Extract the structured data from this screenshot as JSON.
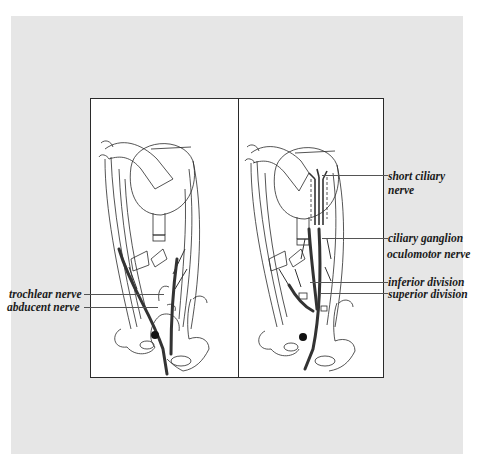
{
  "figure": {
    "panels": [
      {
        "id": "left",
        "description": "Orbit with extraocular muscles showing trochlear and abducent nerves"
      },
      {
        "id": "right",
        "description": "Orbit showing oculomotor nerve divisions, ciliary ganglion and short ciliary nerves"
      }
    ],
    "labels_left": [
      {
        "text": "trochlear nerve"
      },
      {
        "text": "abducent nerve"
      }
    ],
    "labels_right": [
      {
        "text": "short ciliary"
      },
      {
        "text": "nerve"
      },
      {
        "text": "ciliary ganglion"
      },
      {
        "text": "oculomotor nerve"
      },
      {
        "text": "inferior division"
      },
      {
        "text": "superior division"
      }
    ]
  },
  "colors": {
    "background": "#e6e6e6",
    "figure_fill": "#ffffff",
    "line": "#2a2a2a",
    "nerve": "#333333"
  }
}
